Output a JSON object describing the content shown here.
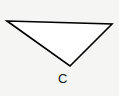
{
  "figure": {
    "kind": "geometry-diagram",
    "canvas": {
      "width": 119,
      "height": 96,
      "background_color": "#f5f5f3"
    },
    "shape": {
      "name": "triangle",
      "fill_color": "#ffffff",
      "stroke_color": "#000000",
      "stroke_width": 1.6,
      "points": "7,21 112,24 70,66",
      "vertices": [
        {
          "id": "top-left",
          "x": 7,
          "y": 21,
          "label": ""
        },
        {
          "id": "top-right",
          "x": 112,
          "y": 24,
          "label": ""
        },
        {
          "id": "bottom",
          "x": 70,
          "y": 66,
          "label": "C"
        }
      ]
    },
    "labels": [
      {
        "id": "c",
        "text": "C",
        "x": 58,
        "y": 72,
        "color": "#171717",
        "font_size": 13
      }
    ]
  }
}
